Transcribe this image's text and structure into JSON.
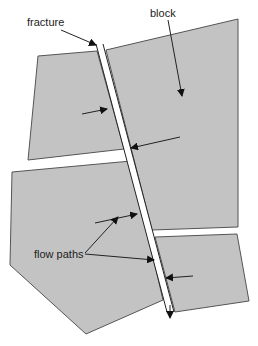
{
  "diagram": {
    "labels": {
      "fracture": "fracture",
      "block": "block",
      "flow_paths": "flow paths"
    },
    "colors": {
      "block_fill": "#c3c3c3",
      "block_stroke": "#555555",
      "line": "#222222",
      "background": "#ffffff"
    },
    "blocks": [
      {
        "id": "upper-left-block"
      },
      {
        "id": "upper-right-block"
      },
      {
        "id": "lower-left-block"
      },
      {
        "id": "lower-right-block"
      }
    ]
  }
}
